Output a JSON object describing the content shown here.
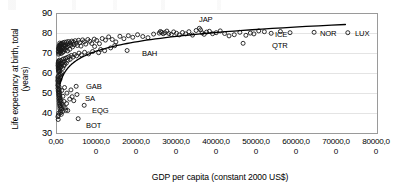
{
  "chart_data": {
    "type": "scatter",
    "title": "",
    "xlabel": "GDP per capita (constant 2000 US$)",
    "ylabel_line1": "Life expectancy at birth, total",
    "ylabel_line2": "(years)",
    "xlim": [
      0,
      80000
    ],
    "ylim": [
      30,
      90
    ],
    "grid": "horizontal",
    "legend": "none",
    "xticks": [
      {
        "l1": "0,00",
        "l2": "",
        "value": 0
      },
      {
        "l1": "10000,0",
        "l2": "0",
        "value": 10000
      },
      {
        "l1": "20000,0",
        "l2": "0",
        "value": 20000
      },
      {
        "l1": "30000,0",
        "l2": "0",
        "value": 30000
      },
      {
        "l1": "40000,0",
        "l2": "0",
        "value": 40000
      },
      {
        "l1": "50000,0",
        "l2": "0",
        "value": 50000
      },
      {
        "l1": "60000,0",
        "l2": "0",
        "value": 60000
      },
      {
        "l1": "70000,0",
        "l2": "0",
        "value": 70000
      },
      {
        "l1": "80000,0",
        "l2": "0",
        "value": 80000
      }
    ],
    "yticks": [
      {
        "label": "90",
        "value": 90
      },
      {
        "label": "80",
        "value": 80
      },
      {
        "label": "70",
        "value": 70
      },
      {
        "label": "60",
        "value": 60
      },
      {
        "label": "50",
        "value": 50
      },
      {
        "label": "40",
        "value": 40
      },
      {
        "label": "30",
        "value": 30
      }
    ],
    "marker": {
      "shape": "open-circle",
      "color": "#1a1a1a",
      "size": 4
    },
    "trendline": {
      "type": "logarithmic",
      "color": "#000000",
      "width": 1.3,
      "x_start": 900,
      "x_end": 72000,
      "y_start": 55.0,
      "y_end": 84.5
    },
    "annotations": [
      {
        "label": "JAP",
        "x": 35600,
        "y": 82.6,
        "lx": 199,
        "ly": 16
      },
      {
        "label": "BAH",
        "x": 17600,
        "y": 71.5,
        "lx": 142,
        "ly": 50
      },
      {
        "label": "ICE",
        "x": 50400,
        "y": 81.3,
        "lx": 275,
        "ly": 31
      },
      {
        "label": "NOR",
        "x": 64200,
        "y": 80.6,
        "lx": 320,
        "ly": 30
      },
      {
        "label": "LUX",
        "x": 72600,
        "y": 80.4,
        "lx": 355,
        "ly": 30
      },
      {
        "label": "QTR",
        "x": 46500,
        "y": 75.1,
        "lx": 272,
        "ly": 42
      },
      {
        "label": "GAB",
        "x": 4900,
        "y": 53.6,
        "lx": 86,
        "ly": 83
      },
      {
        "label": "SA",
        "x": 5100,
        "y": 49.5,
        "lx": 85,
        "ly": 95
      },
      {
        "label": "EQG",
        "x": 6900,
        "y": 44.1,
        "lx": 92,
        "ly": 107
      },
      {
        "label": "BOT",
        "x": 5400,
        "y": 37.4,
        "lx": 86,
        "ly": 122
      }
    ],
    "points": [
      [
        450,
        70.8
      ],
      [
        470,
        72.3
      ],
      [
        520,
        69.6
      ],
      [
        560,
        73.1
      ],
      [
        600,
        71.4
      ],
      [
        640,
        74.0
      ],
      [
        680,
        72.6
      ],
      [
        700,
        70.1
      ],
      [
        740,
        73.5
      ],
      [
        780,
        71.9
      ],
      [
        820,
        75.2
      ],
      [
        860,
        72.0
      ],
      [
        900,
        74.3
      ],
      [
        940,
        70.5
      ],
      [
        980,
        73.8
      ],
      [
        1020,
        71.2
      ],
      [
        1080,
        74.6
      ],
      [
        1130,
        72.8
      ],
      [
        1180,
        70.0
      ],
      [
        1240,
        75.0
      ],
      [
        1300,
        73.2
      ],
      [
        1360,
        71.6
      ],
      [
        1420,
        74.8
      ],
      [
        1480,
        72.4
      ],
      [
        1540,
        70.6
      ],
      [
        1600,
        75.4
      ],
      [
        1680,
        73.0
      ],
      [
        1760,
        71.0
      ],
      [
        1840,
        74.2
      ],
      [
        1920,
        72.2
      ],
      [
        2000,
        75.6
      ],
      [
        2100,
        73.6
      ],
      [
        2200,
        71.8
      ],
      [
        2300,
        74.4
      ],
      [
        2400,
        72.9
      ],
      [
        2520,
        75.8
      ],
      [
        2640,
        73.4
      ],
      [
        2760,
        71.3
      ],
      [
        2880,
        74.9
      ],
      [
        3000,
        76.0
      ],
      [
        3150,
        73.9
      ],
      [
        3300,
        72.1
      ],
      [
        3450,
        75.3
      ],
      [
        3600,
        74.1
      ],
      [
        3800,
        76.2
      ],
      [
        4000,
        73.3
      ],
      [
        4200,
        75.7
      ],
      [
        4400,
        74.5
      ],
      [
        4650,
        76.4
      ],
      [
        4900,
        75.1
      ],
      [
        5200,
        74.0
      ],
      [
        5500,
        76.6
      ],
      [
        5800,
        75.5
      ],
      [
        6100,
        73.7
      ],
      [
        6500,
        76.8
      ],
      [
        6900,
        75.9
      ],
      [
        7300,
        74.7
      ],
      [
        7800,
        77.0
      ],
      [
        8300,
        76.1
      ],
      [
        8800,
        75.0
      ],
      [
        9400,
        77.2
      ],
      [
        10000,
        76.5
      ],
      [
        10700,
        74.9
      ],
      [
        11400,
        77.5
      ],
      [
        12200,
        76.7
      ],
      [
        13000,
        78.3
      ],
      [
        13900,
        77.0
      ],
      [
        14800,
        75.8
      ],
      [
        15800,
        78.6
      ],
      [
        16800,
        77.4
      ],
      [
        17600,
        71.5
      ],
      [
        17900,
        78.9
      ],
      [
        19000,
        78.1
      ],
      [
        20200,
        79.4
      ],
      [
        21500,
        78.5
      ],
      [
        22800,
        77.9
      ],
      [
        24200,
        79.7
      ],
      [
        25600,
        80.2
      ],
      [
        25900,
        81.0
      ],
      [
        26200,
        80.6
      ],
      [
        26600,
        79.9
      ],
      [
        27000,
        80.4
      ],
      [
        27500,
        81.2
      ],
      [
        28000,
        80.0
      ],
      [
        28600,
        79.5
      ],
      [
        29200,
        80.8
      ],
      [
        29900,
        80.1
      ],
      [
        30600,
        79.3
      ],
      [
        31400,
        80.5
      ],
      [
        32200,
        79.8
      ],
      [
        33000,
        80.9
      ],
      [
        33900,
        79.2
      ],
      [
        34800,
        81.5
      ],
      [
        35600,
        82.6
      ],
      [
        35900,
        81.8
      ],
      [
        36300,
        80.3
      ],
      [
        36800,
        79.6
      ],
      [
        37400,
        80.7
      ],
      [
        38100,
        81.1
      ],
      [
        38900,
        79.9
      ],
      [
        39800,
        80.4
      ],
      [
        40800,
        81.3
      ],
      [
        41900,
        80.0
      ],
      [
        43000,
        78.8
      ],
      [
        44300,
        79.4
      ],
      [
        45700,
        80.6
      ],
      [
        46500,
        75.1
      ],
      [
        47200,
        79.1
      ],
      [
        48300,
        80.2
      ],
      [
        49200,
        79.8
      ],
      [
        50400,
        81.3
      ],
      [
        51800,
        80.9
      ],
      [
        53500,
        80.1
      ],
      [
        55800,
        81.0
      ],
      [
        58200,
        80.4
      ],
      [
        64200,
        80.6
      ],
      [
        72600,
        80.4
      ],
      [
        380,
        63.9
      ],
      [
        400,
        64.8
      ],
      [
        420,
        62.7
      ],
      [
        440,
        65.4
      ],
      [
        460,
        61.8
      ],
      [
        480,
        66.2
      ],
      [
        500,
        63.2
      ],
      [
        540,
        64.4
      ],
      [
        580,
        60.9
      ],
      [
        620,
        65.8
      ],
      [
        660,
        62.3
      ],
      [
        720,
        66.7
      ],
      [
        760,
        63.6
      ],
      [
        800,
        61.4
      ],
      [
        850,
        64.1
      ],
      [
        890,
        59.8
      ],
      [
        930,
        65.0
      ],
      [
        970,
        62.9
      ],
      [
        1050,
        66.4
      ],
      [
        1150,
        63.4
      ],
      [
        1250,
        60.4
      ],
      [
        1350,
        64.9
      ],
      [
        1450,
        66.9
      ],
      [
        1550,
        62.6
      ],
      [
        1650,
        65.6
      ],
      [
        1750,
        67.3
      ],
      [
        1850,
        63.8
      ],
      [
        1950,
        66.0
      ],
      [
        2050,
        64.6
      ],
      [
        2250,
        67.6
      ],
      [
        2450,
        65.2
      ],
      [
        2650,
        68.0
      ],
      [
        2850,
        66.6
      ],
      [
        3100,
        68.4
      ],
      [
        3400,
        67.1
      ],
      [
        3700,
        69.0
      ],
      [
        4100,
        68.2
      ],
      [
        4500,
        69.5
      ],
      [
        5000,
        68.8
      ],
      [
        5600,
        70.2
      ],
      [
        6200,
        69.3
      ],
      [
        7000,
        70.6
      ],
      [
        8000,
        69.8
      ],
      [
        9000,
        71.0
      ],
      [
        10500,
        70.4
      ],
      [
        12000,
        71.4
      ],
      [
        13500,
        72.8
      ],
      [
        9500,
        73.5
      ],
      [
        11000,
        72.0
      ],
      [
        14500,
        73.9
      ],
      [
        300,
        56.4
      ],
      [
        320,
        54.1
      ],
      [
        340,
        57.8
      ],
      [
        360,
        52.6
      ],
      [
        380,
        55.2
      ],
      [
        400,
        58.5
      ],
      [
        420,
        51.3
      ],
      [
        440,
        53.8
      ],
      [
        460,
        56.9
      ],
      [
        480,
        50.1
      ],
      [
        500,
        54.6
      ],
      [
        520,
        57.2
      ],
      [
        540,
        48.9
      ],
      [
        560,
        52.0
      ],
      [
        580,
        55.8
      ],
      [
        600,
        47.5
      ],
      [
        620,
        50.8
      ],
      [
        640,
        53.3
      ],
      [
        660,
        46.2
      ],
      [
        680,
        49.4
      ],
      [
        700,
        51.9
      ],
      [
        720,
        44.8
      ],
      [
        740,
        47.9
      ],
      [
        760,
        50.5
      ],
      [
        780,
        43.6
      ],
      [
        800,
        46.5
      ],
      [
        820,
        49.1
      ],
      [
        840,
        42.4
      ],
      [
        870,
        45.3
      ],
      [
        900,
        48.0
      ],
      [
        930,
        41.2
      ],
      [
        960,
        44.0
      ],
      [
        1000,
        46.8
      ],
      [
        1050,
        40.4
      ],
      [
        1100,
        43.1
      ],
      [
        1150,
        45.9
      ],
      [
        1200,
        39.6
      ],
      [
        1280,
        42.3
      ],
      [
        1380,
        44.7
      ],
      [
        1500,
        41.0
      ],
      [
        1700,
        43.5
      ],
      [
        1900,
        46.0
      ],
      [
        2150,
        42.8
      ],
      [
        2500,
        45.0
      ],
      [
        350,
        38.4
      ],
      [
        420,
        37.0
      ],
      [
        480,
        39.1
      ],
      [
        560,
        40.2
      ],
      [
        2800,
        41.5
      ],
      [
        3300,
        47.2
      ],
      [
        3900,
        48.4
      ],
      [
        4900,
        53.6
      ],
      [
        5100,
        49.5
      ],
      [
        5400,
        37.4
      ],
      [
        6900,
        44.1
      ],
      [
        2300,
        41.6
      ],
      [
        1600,
        48.6
      ],
      [
        1300,
        51.5
      ],
      [
        1000,
        58.2
      ],
      [
        1150,
        59.4
      ],
      [
        850,
        57.0
      ],
      [
        640,
        59.2
      ],
      [
        560,
        61.1
      ],
      [
        2000,
        53.0
      ],
      [
        2600,
        50.2
      ],
      [
        3600,
        51.8
      ],
      [
        4300,
        46.4
      ]
    ]
  }
}
